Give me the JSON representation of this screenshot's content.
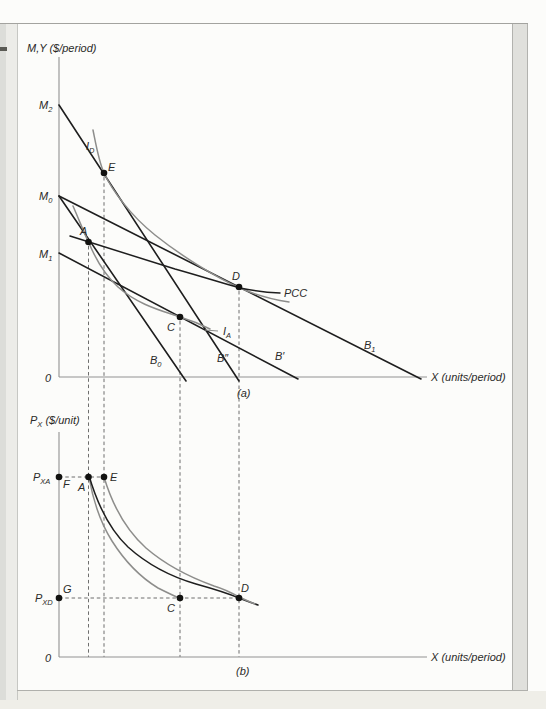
{
  "figure": {
    "colors": {
      "budget_line": "#1e1e1e",
      "indifference_curve": "#8d8d8b",
      "dashed_guide": "#5f5f5d",
      "axis": "#919191",
      "page_edge_strip": "#e0e0dc"
    },
    "panel_a": {
      "axes": {
        "x0": 59,
        "y_top": 57,
        "y_bottom": 377,
        "x_right": 427
      },
      "y_axis_label": {
        "name": "panel-a-y-axis-label",
        "x": 27,
        "y": 52,
        "parts": [
          {
            "t": "M,Y ($/period)"
          }
        ]
      },
      "x_axis_label": {
        "name": "panel-a-x-axis-label",
        "x": 431,
        "y": 381,
        "parts": [
          {
            "t": "X (units/period)"
          }
        ]
      },
      "origin_label": {
        "name": "panel-a-origin-label",
        "x": 45,
        "y": 382,
        "parts": [
          {
            "t": "0"
          }
        ]
      },
      "caption": {
        "name": "panel-a-caption",
        "x": 237,
        "y": 397,
        "parts": [
          {
            "t": "(a)"
          }
        ]
      },
      "income_intercept_labels": [
        {
          "name": "label-M2",
          "x": 39,
          "y": 109,
          "parts": [
            {
              "t": "M"
            },
            {
              "t": "2",
              "sub": true
            }
          ]
        },
        {
          "name": "label-M0",
          "x": 39,
          "y": 200,
          "parts": [
            {
              "t": "M"
            },
            {
              "t": "0",
              "sub": true
            }
          ]
        },
        {
          "name": "label-M1",
          "x": 39,
          "y": 258,
          "parts": [
            {
              "t": "M"
            },
            {
              "t": "1",
              "sub": true
            }
          ]
        }
      ],
      "budget_lines": [
        {
          "name": "budget-line-B0",
          "x1": 59,
          "y1": 196,
          "x2": 186,
          "y2": 381
        },
        {
          "name": "budget-line-B-doubleprime",
          "x1": 59,
          "y1": 105,
          "x2": 239,
          "y2": 381
        },
        {
          "name": "budget-line-B-prime",
          "x1": 59,
          "y1": 253,
          "x2": 298,
          "y2": 379
        },
        {
          "name": "budget-line-B1",
          "x1": 59,
          "y1": 196,
          "x2": 421,
          "y2": 379
        }
      ],
      "curves": [
        {
          "name": "indifference-curve-IA",
          "color": "gray",
          "d": "M 73,206 C 80,222 84,233 89,243 C 96,260 104,274 118,287 C 138,305 163,311 180,317 C 190,320 200,324 210,329"
        },
        {
          "name": "indifference-curve-ID",
          "color": "gray",
          "d": "M 93,130 C 97,150 99,162 104,173 C 112,190 130,215 155,235 C 180,255 215,277 240,288 C 258,296 275,300 289,302"
        },
        {
          "name": "price-consumption-curve",
          "color": "black",
          "d": "M 70,236 C 105,247 140,258 175,269 C 200,276 222,283 240,288 C 255,291 268,292.5 280,293"
        }
      ],
      "ia_leader": {
        "x1": 205,
        "y1": 330,
        "x2": 218,
        "y2": 331
      },
      "curve_labels": [
        {
          "name": "label-B0",
          "x": 150,
          "y": 364,
          "parts": [
            {
              "t": "B"
            },
            {
              "t": "0",
              "sub": true
            }
          ]
        },
        {
          "name": "label-B-doubleprime",
          "x": 217,
          "y": 362,
          "parts": [
            {
              "t": "B″"
            }
          ]
        },
        {
          "name": "label-B-prime",
          "x": 275,
          "y": 360,
          "parts": [
            {
              "t": "B′"
            }
          ]
        },
        {
          "name": "label-B1",
          "x": 364,
          "y": 349,
          "parts": [
            {
              "t": "B"
            },
            {
              "t": "1",
              "sub": true
            }
          ]
        },
        {
          "name": "label-PCC",
          "x": 284,
          "y": 297,
          "parts": [
            {
              "t": "PCC"
            }
          ]
        },
        {
          "name": "label-ID",
          "x": 86,
          "y": 150,
          "parts": [
            {
              "t": "I"
            },
            {
              "t": "D",
              "sub": true
            }
          ]
        },
        {
          "name": "label-IA",
          "x": 223,
          "y": 335,
          "parts": [
            {
              "t": "I"
            },
            {
              "t": "A",
              "sub": true
            }
          ]
        }
      ],
      "points": [
        {
          "name": "point-A",
          "x": 88.5,
          "y": 242,
          "lx": 80,
          "ly": 235,
          "label": "A"
        },
        {
          "name": "point-E",
          "x": 104,
          "y": 173,
          "lx": 108,
          "ly": 171,
          "label": "E"
        },
        {
          "name": "point-C",
          "x": 180,
          "y": 317,
          "lx": 167,
          "ly": 331,
          "label": "C"
        },
        {
          "name": "point-D",
          "x": 239,
          "y": 287,
          "lx": 232,
          "ly": 280,
          "label": "D"
        }
      ],
      "dashed_drops": [
        {
          "name": "guide-drop-A",
          "x": 88.5,
          "y1": 246,
          "y2": 657
        },
        {
          "name": "guide-drop-E",
          "x": 104,
          "y1": 177,
          "y2": 657
        },
        {
          "name": "guide-drop-C",
          "x": 180,
          "y1": 321,
          "y2": 657
        },
        {
          "name": "guide-drop-D",
          "x": 239,
          "y1": 291,
          "y2": 657
        }
      ]
    },
    "panel_b": {
      "axes": {
        "x0": 59,
        "y_top": 432,
        "y_bottom": 657,
        "x_right": 427
      },
      "y_axis_label": {
        "name": "panel-b-y-axis-label",
        "x": 30,
        "y": 424,
        "parts": [
          {
            "t": "P"
          },
          {
            "t": "X",
            "sub": true
          },
          {
            "t": " ($/unit)"
          }
        ]
      },
      "x_axis_label": {
        "name": "panel-b-x-axis-label",
        "x": 431,
        "y": 661,
        "parts": [
          {
            "t": "X (units/period)"
          }
        ]
      },
      "origin_label": {
        "name": "panel-b-origin-label",
        "x": 45,
        "y": 662,
        "parts": [
          {
            "t": "0"
          }
        ]
      },
      "caption": {
        "name": "panel-b-caption",
        "x": 236,
        "y": 675,
        "parts": [
          {
            "t": "(b)"
          }
        ]
      },
      "price_labels": [
        {
          "name": "label-PXA",
          "x": 33,
          "y": 481,
          "parts": [
            {
              "t": "P"
            },
            {
              "t": "XA",
              "sub": true
            }
          ]
        },
        {
          "name": "label-PXD",
          "x": 35,
          "y": 602,
          "parts": [
            {
              "t": "P"
            },
            {
              "t": "XD",
              "sub": true
            }
          ]
        }
      ],
      "dashed_levels": [
        {
          "name": "guide-price-PXA",
          "y": 477,
          "x1": 59,
          "x2": 104
        },
        {
          "name": "guide-price-PXD",
          "y": 598,
          "x1": 59,
          "x2": 239
        }
      ],
      "curves": [
        {
          "name": "compensated-demand-A-C",
          "color": "gray",
          "d": "M 89,477 C 93,500 100,522 112,541 C 124,560 140,577 158,588 C 166,592 172,595 179,598"
        },
        {
          "name": "ordinary-demand-A-D",
          "color": "black",
          "d": "M 88.5,474 C 98,507 110,530 128,547 C 148,565 172,577 196,584 C 214,589 227,593 239,598 C 247,601 252,603 258,605"
        },
        {
          "name": "compensated-demand-E-D",
          "color": "gray",
          "d": "M 104,477 C 113,507 126,530 146,548 C 168,567 192,578 214,586 C 224,589 232,593 239,597 C 246,600 250,602 255,604"
        }
      ],
      "points": [
        {
          "name": "point-F",
          "x": 59,
          "y": 477,
          "lx": 63,
          "ly": 488,
          "label": "F"
        },
        {
          "name": "point-A",
          "x": 88.5,
          "y": 477,
          "lx": 78,
          "ly": 491,
          "label": "A"
        },
        {
          "name": "point-E",
          "x": 104,
          "y": 477,
          "lx": 110,
          "ly": 481,
          "label": "E"
        },
        {
          "name": "point-G",
          "x": 59,
          "y": 598,
          "lx": 63,
          "ly": 593,
          "label": "G"
        },
        {
          "name": "point-C",
          "x": 180,
          "y": 598,
          "lx": 167,
          "ly": 612,
          "label": "C"
        },
        {
          "name": "point-D",
          "x": 239,
          "y": 598,
          "lx": 241,
          "ly": 592,
          "label": "D"
        }
      ]
    }
  }
}
